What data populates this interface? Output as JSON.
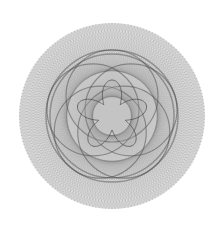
{
  "image": {
    "subject": "string-art spirograph rosette",
    "background": "#ffffff",
    "ink": "#4a4a4a",
    "center": [
      112,
      116
    ],
    "outer_radius": 93
  },
  "layers": {
    "outer_disk": {
      "radius": 93,
      "points": 180,
      "step": 61,
      "opacity": 0.22
    },
    "dark_ring": {
      "radius": 66,
      "width": 3,
      "opacity": 0.45
    },
    "overlap_circles": {
      "count": 5,
      "offset": 20,
      "radius": 46,
      "opacity": 0.5
    },
    "flower": {
      "petals": 5,
      "inner_radius": 14,
      "outer_radius": 36,
      "opacity": 0.35
    }
  }
}
